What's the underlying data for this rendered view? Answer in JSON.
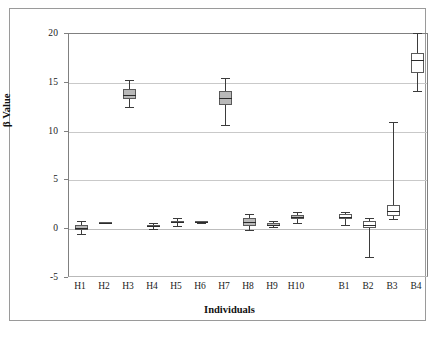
{
  "chart_data": {
    "type": "box",
    "title": "",
    "xlabel": "Individuals",
    "ylabel": "β Value",
    "ylim": [
      -5,
      20
    ],
    "yticks": [
      -5,
      0,
      5,
      10,
      15,
      20
    ],
    "ytick_labels": [
      "-5",
      "0",
      "5",
      "10",
      "15",
      "20"
    ],
    "grid": "horizontal",
    "legend": "none",
    "categories": [
      "H1",
      "H2",
      "H3",
      "H4",
      "H5",
      "H6",
      "H7",
      "H8",
      "H9",
      "H10",
      "",
      "B1",
      "B2",
      "B3",
      "B4"
    ],
    "boxes": [
      {
        "label": "H1",
        "whisker_low": -0.5,
        "q1": -0.1,
        "median": 0.1,
        "q3": 0.4,
        "whisker_high": 0.8,
        "fill": "gray"
      },
      {
        "label": "H2",
        "whisker_low": 0.6,
        "q1": 0.6,
        "median": 0.65,
        "q3": 0.7,
        "whisker_high": 0.7,
        "fill": "gray"
      },
      {
        "label": "H3",
        "whisker_low": 12.5,
        "q1": 13.3,
        "median": 13.8,
        "q3": 14.4,
        "whisker_high": 15.3,
        "fill": "gray"
      },
      {
        "label": "H4",
        "whisker_low": 0.0,
        "q1": 0.2,
        "median": 0.3,
        "q3": 0.45,
        "whisker_high": 0.6,
        "fill": "gray"
      },
      {
        "label": "H5",
        "whisker_low": 0.35,
        "q1": 0.6,
        "median": 0.7,
        "q3": 0.85,
        "whisker_high": 1.1,
        "fill": "gray"
      },
      {
        "label": "H6",
        "whisker_low": 0.6,
        "q1": 0.65,
        "median": 0.7,
        "q3": 0.8,
        "whisker_high": 0.85,
        "fill": "gray"
      },
      {
        "label": "H7",
        "whisker_low": 10.7,
        "q1": 12.7,
        "median": 13.4,
        "q3": 14.2,
        "whisker_high": 15.5,
        "fill": "gray"
      },
      {
        "label": "H8",
        "whisker_low": -0.1,
        "q1": 0.3,
        "median": 0.7,
        "q3": 1.1,
        "whisker_high": 1.6,
        "fill": "gray"
      },
      {
        "label": "H9",
        "whisker_low": 0.25,
        "q1": 0.35,
        "median": 0.45,
        "q3": 0.65,
        "whisker_high": 0.85,
        "fill": "gray"
      },
      {
        "label": "H10",
        "whisker_low": 0.6,
        "q1": 1.0,
        "median": 1.2,
        "q3": 1.5,
        "whisker_high": 1.8,
        "fill": "gray"
      },
      {
        "label": "B1",
        "whisker_low": 0.4,
        "q1": 1.0,
        "median": 1.3,
        "q3": 1.6,
        "whisker_high": 1.75,
        "fill": "white"
      },
      {
        "label": "B2",
        "whisker_low": -2.8,
        "q1": 0.1,
        "median": 0.45,
        "q3": 0.8,
        "whisker_high": 1.15,
        "fill": "white"
      },
      {
        "label": "B3",
        "whisker_low": 1.0,
        "q1": 1.4,
        "median": 1.9,
        "q3": 2.5,
        "whisker_high": 11.0,
        "fill": "white"
      },
      {
        "label": "B4",
        "whisker_low": 14.2,
        "q1": 16.0,
        "median": 17.3,
        "q3": 18.1,
        "whisker_high": 20.1,
        "fill": "white"
      }
    ]
  },
  "axes": {
    "y_label": "β Value",
    "x_label": "Individuals",
    "y_tick_labels": [
      "20",
      "15",
      "10",
      "5",
      "0",
      "-5"
    ],
    "x_tick_labels": [
      "H1",
      "H2",
      "H3",
      "H4",
      "H5",
      "H6",
      "H7",
      "H8",
      "H9",
      "H10",
      "B1",
      "B2",
      "B3",
      "B4"
    ]
  },
  "caption": {
    "text": ""
  }
}
